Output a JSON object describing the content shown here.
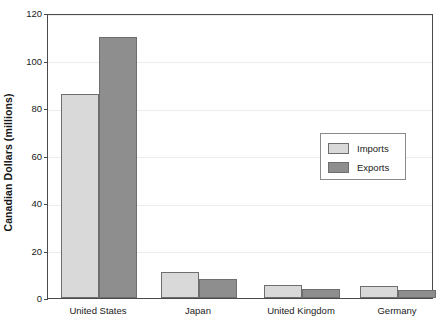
{
  "chart_data": {
    "type": "bar",
    "title": "",
    "xlabel": "",
    "ylabel": "Canadian Dollars (millions)",
    "categories": [
      "United States",
      "Japan",
      "United Kingdom",
      "Germany"
    ],
    "series": [
      {
        "name": "Imports",
        "color": "#d9d9d9",
        "values": [
          86,
          11,
          5.5,
          5
        ]
      },
      {
        "name": "Exports",
        "color": "#8e8e8e",
        "values": [
          110,
          8,
          4,
          3.5
        ]
      }
    ],
    "ylim": [
      0,
      120
    ],
    "yticks": [
      0,
      20,
      40,
      60,
      80,
      100,
      120
    ],
    "ytick_labels": [
      "0",
      "20",
      "40",
      "60",
      "80",
      "100",
      "120"
    ],
    "grid": true,
    "grid_axis": "y",
    "legend_position": "center-right",
    "legend_entries": [
      "Imports",
      "Exports"
    ],
    "frame": true
  },
  "legend": {
    "imports_label": "Imports",
    "exports_label": "Exports"
  },
  "axis": {
    "y_title": "Canadian Dollars (millions)"
  }
}
